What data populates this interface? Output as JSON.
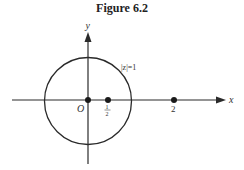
{
  "figure": {
    "title": "Figure 6.2",
    "axes": {
      "x_label": "x",
      "y_label": "y",
      "origin_label": "O"
    },
    "circle": {
      "label": "|z|=1",
      "center": [
        0,
        0
      ],
      "radius": 1
    },
    "points": [
      {
        "label": "O",
        "x": 0
      },
      {
        "label_num": "1",
        "label_den": "2",
        "x": 0.5
      },
      {
        "label": "2",
        "x": 2
      }
    ],
    "colors": {
      "ink": "#2a2a2a",
      "background": "#ffffff"
    }
  }
}
